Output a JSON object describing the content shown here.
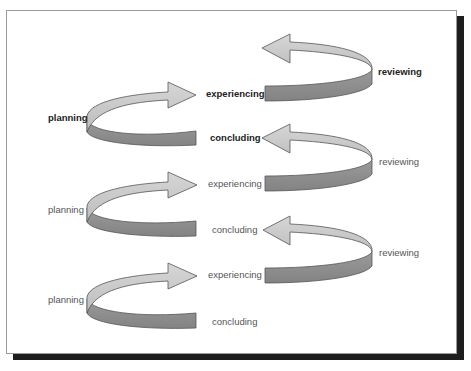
{
  "diagram": {
    "title": "",
    "colors": {
      "light_band": "#c8c8c8",
      "dark_band": "#8e8e8e",
      "outline": "#555555",
      "frame_border": "#9a9a9a",
      "shadow": "#1e1e1e"
    },
    "cycles": [
      {
        "emphasis": "bold",
        "planning": "planning",
        "experiencing": "experiencing",
        "reviewing": "reviewing",
        "concluding": "concluding"
      },
      {
        "emphasis": "normal",
        "planning": "planning",
        "experiencing": "experiencing",
        "reviewing": "reviewing",
        "concluding": "concluding"
      },
      {
        "emphasis": "normal",
        "planning": "planning",
        "experiencing": "experiencing",
        "reviewing": "reviewing",
        "concluding": "concluding"
      }
    ]
  }
}
